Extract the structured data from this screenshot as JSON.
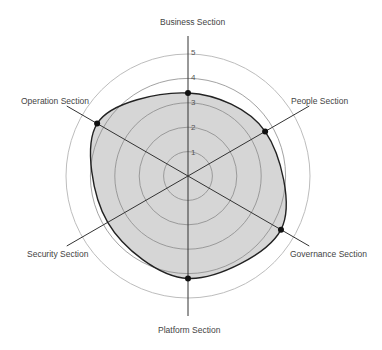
{
  "chart_data": {
    "type": "radar",
    "title": "",
    "axes": [
      "Business Section",
      "People Section",
      "Governance Section",
      "Platform Section",
      "Security Section",
      "Operation Section"
    ],
    "series": [
      {
        "name": "Score",
        "values": [
          3.4,
          3.65,
          4.4,
          4.2,
          3.8,
          4.3
        ],
        "markers": [
          true,
          true,
          true,
          true,
          false,
          true
        ]
      }
    ],
    "radial_ticks": [
      "1",
      "2",
      "3",
      "4",
      "5"
    ],
    "rlim": [
      0,
      5
    ],
    "grid": true,
    "legend": "none",
    "colors": {
      "fill": "#d6d6d6",
      "outline": "#222222",
      "spoke": "#333333",
      "ring": "#8a8a8a",
      "outer_ring": "#bdbdbd"
    }
  }
}
